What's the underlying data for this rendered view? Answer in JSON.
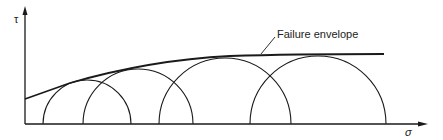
{
  "diagram": {
    "axes": {
      "y_label": "τ",
      "x_label": "σ"
    },
    "envelope_label": "Failure envelope",
    "circles": [
      {
        "center_x": 87,
        "radius": 44
      },
      {
        "center_x": 138,
        "radius": 55
      },
      {
        "center_x": 225,
        "radius": 66
      },
      {
        "center_x": 318,
        "radius": 68
      }
    ],
    "colors": {
      "line": "#1a1a1a",
      "background": "#ffffff"
    }
  }
}
